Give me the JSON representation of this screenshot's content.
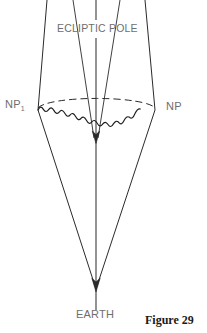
{
  "figure": {
    "caption": "Figure 29",
    "labels": {
      "ecliptic_pole": "ECLIPTIC POLE",
      "north_pole_past": "NP",
      "north_pole_past_subscript": "1",
      "north_pole": "NP",
      "earth": "EARTH"
    },
    "colors": {
      "background": "#ffffff",
      "stroke": "#1a1a1a",
      "label_text": "#6e6e6e",
      "caption_text": "#1a1a1a"
    },
    "geometry": {
      "description": "Precession of the Earth's axis: a cone whose apex is at the Earth and whose base is the circle traced by the north celestial pole around the ecliptic pole.",
      "earth_apex": [
        96,
        289
      ],
      "cone_base_center": [
        96,
        108
      ],
      "cone_base_radius_x": 59,
      "cone_base_radius_y": 11,
      "ecliptic_pole_axis": [
        96,
        0,
        96,
        310
      ],
      "precession_circle_front": "wavy",
      "precession_circle_back": "dashed",
      "np_point": [
        155,
        110
      ],
      "np1_point": [
        38,
        110
      ],
      "inner_apex": [
        96,
        141
      ],
      "arrowheads": [
        "inner-apex-down",
        "earth-apex-down"
      ]
    }
  }
}
